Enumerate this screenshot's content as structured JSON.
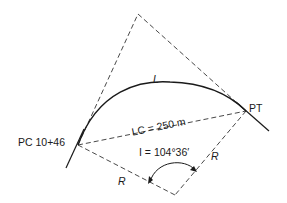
{
  "diagram": {
    "type": "circular-curve-geometry",
    "labels": {
      "pc": "PC 10+46",
      "pt": "PT",
      "arc_length": "L",
      "long_chord": "LC = 250 m",
      "intersection_angle": "I = 104°36′",
      "radius_left": "R",
      "radius_right": "R"
    },
    "colors": {
      "stroke": "#1a1a1a",
      "dashed": "#333333",
      "background": "#ffffff"
    }
  }
}
